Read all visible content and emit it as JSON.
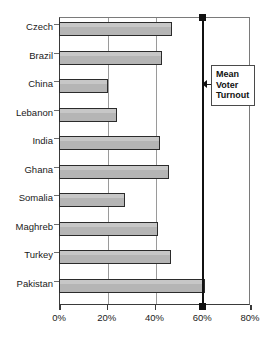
{
  "chart_data": {
    "type": "bar",
    "orientation": "horizontal",
    "title": "",
    "xlabel": "",
    "ylabel": "",
    "categories": [
      "Czech",
      "Brazil",
      "China",
      "Lebanon",
      "India",
      "Ghana",
      "Somalia",
      "Maghreb",
      "Turkey",
      "Pakistan"
    ],
    "values": [
      47.5,
      43.0,
      20.5,
      24.5,
      42.5,
      46.0,
      27.5,
      41.5,
      47.0,
      61.0
    ],
    "series": [
      {
        "name": "Voter Turnout",
        "values": [
          47.5,
          43.0,
          20.5,
          24.5,
          42.5,
          46.0,
          27.5,
          41.5,
          47.0,
          61.0
        ]
      }
    ],
    "xlim": [
      0,
      80
    ],
    "xticks": [
      0,
      20,
      40,
      60,
      80
    ],
    "xticklabels": [
      "0%",
      "20%",
      "40%",
      "60%",
      "80%"
    ],
    "grid": "vertical",
    "legend": "none",
    "bar_fill_color": "#b5b5b5",
    "bar_border_color": "#2b2b2b",
    "axis_color": "#3a3a3a",
    "gridline_color": "#9a9a9a",
    "annotations": [
      {
        "name": "mean-voter-turnout",
        "label_lines": [
          "Mean",
          "Voter",
          "Turnout"
        ],
        "value": 60,
        "style": "vertical-line-with-square-caps",
        "color": "#111111"
      }
    ]
  }
}
